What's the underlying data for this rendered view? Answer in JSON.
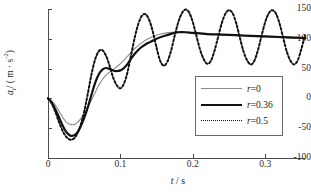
{
  "chart_data": {
    "type": "line",
    "title": "",
    "xlabel": "t / s",
    "ylabel": "a_t / (m · s⁻²)",
    "xlim": [
      0,
      0.355
    ],
    "ylim": [
      -100,
      150
    ],
    "xticks": [
      0,
      0.1,
      0.2,
      0.3
    ],
    "xtick_labels": [
      "0",
      "0.1",
      "0.2",
      "0.3"
    ],
    "yticks": [
      -100,
      -50,
      0,
      50,
      100,
      150
    ],
    "ytick_labels": [
      "-100",
      "-50",
      "0",
      "50",
      "100",
      "150"
    ],
    "grid": false,
    "legend_position": "center-right",
    "series": [
      {
        "name": "r=0",
        "style": "solid-thin",
        "color": "#8c8c8c",
        "x": [
          0.0,
          0.004,
          0.008,
          0.012,
          0.016,
          0.02,
          0.024,
          0.028,
          0.032,
          0.036,
          0.04,
          0.044,
          0.048,
          0.052,
          0.056,
          0.06,
          0.064,
          0.068,
          0.072,
          0.076,
          0.08,
          0.086,
          0.092,
          0.098,
          0.104,
          0.11,
          0.116,
          0.122,
          0.128,
          0.134,
          0.14,
          0.148,
          0.156,
          0.164,
          0.172,
          0.18,
          0.19,
          0.2,
          0.22,
          0.24,
          0.26,
          0.28,
          0.3,
          0.32,
          0.34,
          0.355
        ],
        "y": [
          0,
          -3,
          -8,
          -15,
          -23,
          -31,
          -38,
          -42,
          -44,
          -44,
          -41,
          -36,
          -29,
          -21,
          -12,
          -3,
          7,
          17,
          26,
          33,
          39,
          45,
          50,
          56,
          63,
          71,
          79,
          86,
          92,
          97,
          101,
          105,
          108,
          110,
          111,
          112,
          111,
          110,
          108,
          107,
          105,
          104,
          103,
          102,
          101,
          101
        ]
      },
      {
        "name": "r=0.36",
        "style": "solid-thick",
        "color": "#111111",
        "x": [
          0.0,
          0.004,
          0.008,
          0.012,
          0.016,
          0.02,
          0.024,
          0.028,
          0.032,
          0.036,
          0.04,
          0.044,
          0.048,
          0.052,
          0.056,
          0.06,
          0.064,
          0.068,
          0.072,
          0.076,
          0.08,
          0.084,
          0.088,
          0.092,
          0.096,
          0.1,
          0.104,
          0.11,
          0.116,
          0.122,
          0.128,
          0.134,
          0.14,
          0.148,
          0.156,
          0.164,
          0.172,
          0.18,
          0.19,
          0.2,
          0.22,
          0.24,
          0.26,
          0.28,
          0.3,
          0.32,
          0.34,
          0.355
        ],
        "y": [
          0,
          -5,
          -13,
          -23,
          -34,
          -45,
          -54,
          -60,
          -63,
          -62,
          -58,
          -50,
          -39,
          -26,
          -11,
          6,
          22,
          35,
          44,
          49,
          51,
          50,
          48,
          46,
          46,
          47,
          50,
          58,
          69,
          78,
          85,
          90,
          94,
          99,
          103,
          106,
          109,
          111,
          111,
          110,
          108,
          107,
          106,
          105,
          104,
          103,
          102,
          101
        ]
      },
      {
        "name": "r=0.5",
        "style": "dotted",
        "color": "#111111",
        "x": [
          0.0,
          0.005,
          0.01,
          0.015,
          0.02,
          0.025,
          0.03,
          0.035,
          0.04,
          0.045,
          0.05,
          0.055,
          0.06,
          0.065,
          0.07,
          0.075,
          0.08,
          0.085,
          0.09,
          0.095,
          0.1,
          0.105,
          0.11,
          0.115,
          0.12,
          0.125,
          0.13,
          0.135,
          0.14,
          0.145,
          0.15,
          0.155,
          0.16,
          0.165,
          0.17,
          0.175,
          0.18,
          0.185,
          0.19,
          0.195,
          0.2,
          0.205,
          0.21,
          0.215,
          0.22,
          0.225,
          0.23,
          0.235,
          0.24,
          0.245,
          0.25,
          0.255,
          0.26,
          0.265,
          0.27,
          0.275,
          0.28,
          0.285,
          0.29,
          0.295,
          0.3,
          0.305,
          0.31,
          0.315,
          0.32,
          0.325,
          0.33,
          0.335,
          0.34,
          0.345,
          0.35,
          0.355
        ],
        "y": [
          0,
          -8,
          -22,
          -39,
          -54,
          -64,
          -69,
          -68,
          -60,
          -45,
          -22,
          8,
          40,
          65,
          79,
          81,
          72,
          55,
          35,
          22,
          17,
          25,
          45,
          74,
          103,
          126,
          139,
          141,
          131,
          111,
          85,
          63,
          55,
          62,
          80,
          105,
          128,
          143,
          149,
          144,
          128,
          105,
          82,
          66,
          58,
          63,
          80,
          103,
          126,
          142,
          148,
          143,
          126,
          102,
          79,
          64,
          57,
          63,
          81,
          105,
          128,
          143,
          148,
          142,
          125,
          101,
          78,
          63,
          57,
          64,
          83,
          106
        ]
      }
    ]
  },
  "legend": {
    "entries": [
      {
        "label_prefix": "r",
        "label_suffix": "=0"
      },
      {
        "label_prefix": "r",
        "label_suffix": "=0.36"
      },
      {
        "label_prefix": "r",
        "label_suffix": "=0.5"
      }
    ]
  },
  "axis_labels": {
    "y_var": "a",
    "y_sub": "t",
    "y_units": "/ ( m · s",
    "y_exp": "-2",
    "y_close": ")",
    "x_var": "t",
    "x_rest": "/ s"
  }
}
